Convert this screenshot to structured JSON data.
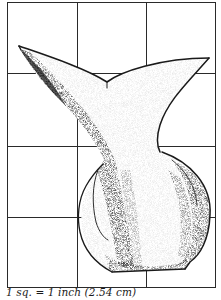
{
  "figure": {
    "grid": {
      "columns": 3,
      "rows": 4,
      "line_color": "#2a2a2a"
    },
    "ink_color": "#1a1a1a",
    "caption": "1 sq. = 1 inch (2.54 cm)"
  }
}
